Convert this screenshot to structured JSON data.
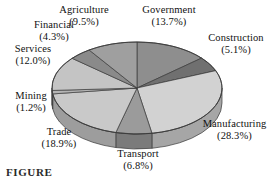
{
  "figure": {
    "caption_partial": "FIGURE"
  },
  "chart_data": {
    "type": "pie",
    "title": "",
    "subtitle": "",
    "xlabel": "",
    "ylabel": "",
    "legend_position": "none",
    "grid": false,
    "three_d": true,
    "start_angle_deg": 0,
    "direction": "clockwise",
    "units": "percent",
    "categories": [
      "Government",
      "Construction",
      "Manufacturing",
      "Transport",
      "Trade",
      "Mining",
      "Services",
      "Financial",
      "Agriculture"
    ],
    "values": [
      13.7,
      5.1,
      28.3,
      6.8,
      18.9,
      1.2,
      12.0,
      4.3,
      9.5
    ],
    "slices": [
      {
        "label": "Government",
        "pct_text": "(13.7%)",
        "value": 13.7,
        "color": "#8e8e8e",
        "side_color": "#6f6f6f"
      },
      {
        "label": "Construction",
        "pct_text": "(5.1%)",
        "value": 5.1,
        "color": "#707070",
        "side_color": "#565656"
      },
      {
        "label": "Manufacturing",
        "pct_text": "(28.3%)",
        "value": 28.3,
        "color": "#d2d2d2",
        "side_color": "#a6a6a6"
      },
      {
        "label": "Transport",
        "pct_text": "(6.8%)",
        "value": 6.8,
        "color": "#9b9b9b",
        "side_color": "#7b7b7b"
      },
      {
        "label": "Trade",
        "pct_text": "(18.9%)",
        "value": 18.9,
        "color": "#c9c9c9",
        "side_color": "#9d9d9d"
      },
      {
        "label": "Mining",
        "pct_text": "(1.2%)",
        "value": 1.2,
        "color": "#b4b4b4",
        "side_color": "#8d8d8d"
      },
      {
        "label": "Services",
        "pct_text": "(12.0%)",
        "value": 12.0,
        "color": "#c4c4c4",
        "side_color": "#9a9a9a"
      },
      {
        "label": "Financial",
        "pct_text": "(4.3%)",
        "value": 4.3,
        "color": "#8a8a8a",
        "side_color": "#6b6b6b"
      },
      {
        "label": "Agriculture",
        "pct_text": "(9.5%)",
        "value": 9.5,
        "color": "#9f9f9f",
        "side_color": "#7d7d7d"
      }
    ]
  },
  "labels": {
    "agriculture": {
      "name": "Agriculture",
      "pct": "(9.5%)"
    },
    "government": {
      "name": "Government",
      "pct": "(13.7%)"
    },
    "construction": {
      "name": "Construction",
      "pct": "(5.1%)"
    },
    "manufacturing": {
      "name": "Manufacturing",
      "pct": "(28.3%)"
    },
    "transport": {
      "name": "Transport",
      "pct": "(6.8%)"
    },
    "trade": {
      "name": "Trade",
      "pct": "(18.9%)"
    },
    "mining": {
      "name": "Mining",
      "pct": "(1.2%)"
    },
    "services": {
      "name": "Services",
      "pct": "(12.0%)"
    },
    "financial": {
      "name": "Financial",
      "pct": "(4.3%)"
    }
  }
}
